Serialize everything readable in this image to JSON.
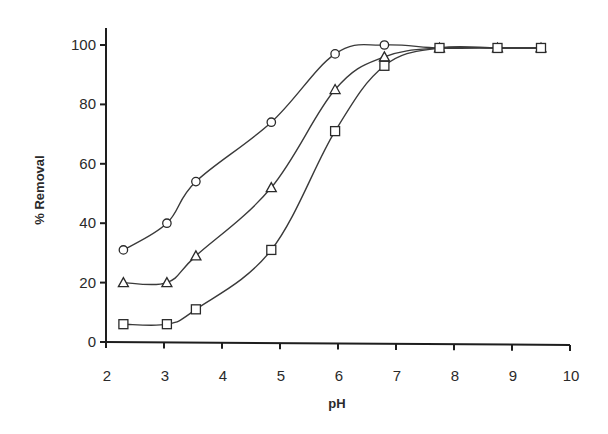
{
  "chart_data": {
    "type": "line",
    "title": "",
    "xlabel": "pH",
    "ylabel": "% Removal",
    "xlim": [
      2,
      10
    ],
    "ylim": [
      0,
      100
    ],
    "x_ticks": [
      "2",
      "3",
      "4",
      "5",
      "6",
      "7",
      "8",
      "9",
      "10"
    ],
    "y_ticks": [
      "0",
      "20",
      "40",
      "60",
      "80",
      "100"
    ],
    "grid": false,
    "legend": null,
    "series": [
      {
        "name": "circle",
        "marker": "circle",
        "x": [
          2.3,
          3.05,
          3.55,
          4.85,
          5.95,
          6.8,
          7.75,
          8.75,
          9.5
        ],
        "values": [
          31,
          40,
          54,
          74,
          97,
          100,
          99,
          99,
          99
        ]
      },
      {
        "name": "triangle",
        "marker": "triangle",
        "x": [
          2.3,
          3.05,
          3.55,
          4.85,
          5.95,
          6.8,
          7.75,
          8.75,
          9.5
        ],
        "values": [
          20,
          20,
          29,
          52,
          85,
          96,
          99,
          99,
          99
        ]
      },
      {
        "name": "square",
        "marker": "square",
        "x": [
          2.3,
          3.05,
          3.55,
          4.85,
          5.95,
          6.8,
          7.75,
          8.75,
          9.5
        ],
        "values": [
          6,
          6,
          11,
          31,
          71,
          93,
          99,
          99,
          99
        ]
      }
    ]
  }
}
